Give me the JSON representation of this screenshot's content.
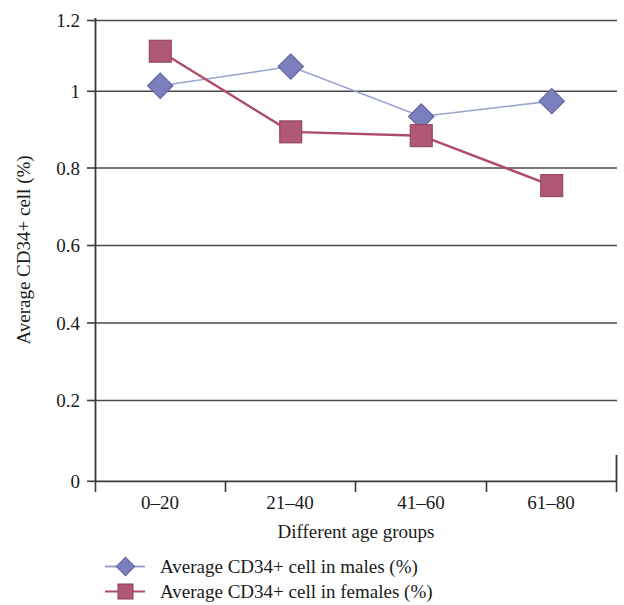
{
  "chart_data": {
    "type": "line",
    "title": "",
    "xlabel": "Different age groups",
    "ylabel": "Average CD34+ cell (%)",
    "categories": [
      "0–20",
      "21–40",
      "41–60",
      "61–80"
    ],
    "series": [
      {
        "name": "Average CD34+ cell in males (%)",
        "values": [
          1.03,
          1.08,
          0.95,
          0.99
        ],
        "color": "#7b7fbe",
        "line_color": "#9aa3cc",
        "marker": "diamond"
      },
      {
        "name": "Average CD34+ cell in females (%)",
        "values": [
          1.12,
          0.91,
          0.9,
          0.77
        ],
        "color": "#b05878",
        "line_color": "#b04a6a",
        "marker": "square"
      }
    ],
    "ylim": [
      0,
      1.2
    ],
    "y_ticks": [
      0,
      0.2,
      0.4,
      0.6,
      0.8,
      1,
      1.2
    ],
    "y_tick_labels": [
      "0",
      "0.2",
      "0.4",
      "0.6",
      "0.8",
      "1",
      "1.2"
    ],
    "grid": true,
    "grid_axis": "y",
    "legend_position": "bottom"
  },
  "axes": {
    "y_tick_labels": [
      "1.2",
      "1",
      "0.8",
      "0.6",
      "0.4",
      "0.2",
      "0"
    ],
    "y_title": "Average CD34+ cell (%)",
    "x_tick_labels": [
      "0–20",
      "21–40",
      "41–60",
      "61–80"
    ],
    "x_title": "Different age groups"
  },
  "legend": {
    "items": [
      {
        "label": "Average CD34+ cell in males (%)",
        "marker": "diamond-marker",
        "color": "#7b7fbe"
      },
      {
        "label": "Average CD34+ cell in females (%)",
        "marker": "square-marker",
        "color": "#b05878"
      }
    ]
  },
  "colors": {
    "males_marker": "#7b7fbe",
    "males_line": "#9aa3cc",
    "females_marker": "#b05878",
    "females_line": "#b04a6a",
    "axis": "#3a3a3a",
    "grid": "#4a4a4a"
  }
}
